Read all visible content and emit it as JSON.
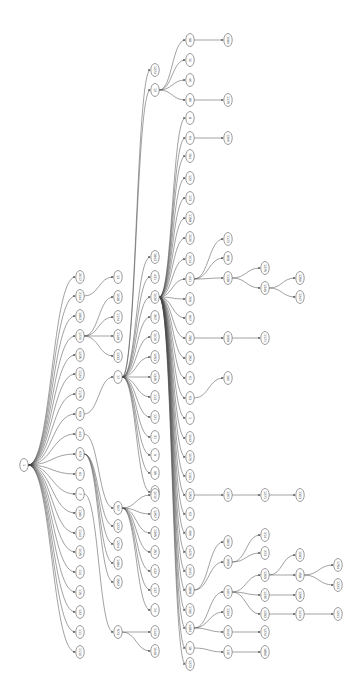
{
  "diagram": {
    "type": "tree",
    "orientation": "left-to-right",
    "root": {
      "id": "r",
      "label": "1",
      "x": 24,
      "y": 465
    },
    "nodes": [
      {
        "id": "a1",
        "label": "2017",
        "x": 80,
        "y": 277
      },
      {
        "id": "a2",
        "label": "2144",
        "x": 80,
        "y": 296
      },
      {
        "id": "a3",
        "label": "1962",
        "x": 80,
        "y": 316
      },
      {
        "id": "a4",
        "label": "1770",
        "x": 80,
        "y": 336
      },
      {
        "id": "a5",
        "label": "1235",
        "x": 80,
        "y": 355
      },
      {
        "id": "a6",
        "label": "1124",
        "x": 80,
        "y": 374
      },
      {
        "id": "a7",
        "label": "1175",
        "x": 80,
        "y": 394
      },
      {
        "id": "a8",
        "label": "609",
        "x": 80,
        "y": 414
      },
      {
        "id": "a9",
        "label": "443",
        "x": 80,
        "y": 434
      },
      {
        "id": "a10",
        "label": "674",
        "x": 80,
        "y": 454
      },
      {
        "id": "a11",
        "label": "91",
        "x": 80,
        "y": 474
      },
      {
        "id": "a12",
        "label": "7",
        "x": 80,
        "y": 494
      },
      {
        "id": "a13",
        "label": "1180",
        "x": 80,
        "y": 513
      },
      {
        "id": "a14",
        "label": "1144",
        "x": 80,
        "y": 533
      },
      {
        "id": "a15",
        "label": "1025",
        "x": 80,
        "y": 552
      },
      {
        "id": "a16",
        "label": "114",
        "x": 80,
        "y": 572
      },
      {
        "id": "a17",
        "label": "115",
        "x": 80,
        "y": 592
      },
      {
        "id": "a18",
        "label": "122",
        "x": 80,
        "y": 612
      },
      {
        "id": "a19",
        "label": "111",
        "x": 80,
        "y": 632
      },
      {
        "id": "a20",
        "label": "1110",
        "x": 80,
        "y": 652
      },
      {
        "id": "b1",
        "label": "13",
        "x": 118,
        "y": 277
      },
      {
        "id": "b2",
        "label": "1038",
        "x": 118,
        "y": 297
      },
      {
        "id": "b3",
        "label": "1174",
        "x": 118,
        "y": 317
      },
      {
        "id": "b4",
        "label": "1149",
        "x": 118,
        "y": 336
      },
      {
        "id": "b5",
        "label": "1233",
        "x": 118,
        "y": 356
      },
      {
        "id": "b6",
        "label": "17",
        "x": 118,
        "y": 377
      },
      {
        "id": "b7",
        "label": "507",
        "x": 118,
        "y": 508
      },
      {
        "id": "b8",
        "label": "1272",
        "x": 118,
        "y": 526
      },
      {
        "id": "b9",
        "label": "1204",
        "x": 118,
        "y": 544
      },
      {
        "id": "b10",
        "label": "1484",
        "x": 118,
        "y": 563
      },
      {
        "id": "b11",
        "label": "1562",
        "x": 118,
        "y": 582
      },
      {
        "id": "b12",
        "label": "573",
        "x": 118,
        "y": 632
      },
      {
        "id": "c1",
        "label": "1274",
        "x": 155,
        "y": 70
      },
      {
        "id": "c2",
        "label": "12",
        "x": 155,
        "y": 90
      },
      {
        "id": "c3",
        "label": "1843",
        "x": 155,
        "y": 257
      },
      {
        "id": "c4",
        "label": "431",
        "x": 155,
        "y": 277
      },
      {
        "id": "c5",
        "label": "1026",
        "x": 155,
        "y": 297
      },
      {
        "id": "c6",
        "label": "367",
        "x": 155,
        "y": 317
      },
      {
        "id": "c7",
        "label": "1016",
        "x": 155,
        "y": 337
      },
      {
        "id": "c8",
        "label": "1053",
        "x": 155,
        "y": 357
      },
      {
        "id": "c9",
        "label": "1345",
        "x": 155,
        "y": 377
      },
      {
        "id": "c10",
        "label": "113",
        "x": 155,
        "y": 397
      },
      {
        "id": "c11",
        "label": "121",
        "x": 155,
        "y": 417
      },
      {
        "id": "c12",
        "label": "31",
        "x": 155,
        "y": 437
      },
      {
        "id": "c13",
        "label": "9",
        "x": 155,
        "y": 455
      },
      {
        "id": "c14",
        "label": "95",
        "x": 155,
        "y": 473
      },
      {
        "id": "c15",
        "label": "170",
        "x": 155,
        "y": 492
      },
      {
        "id": "c16",
        "label": "1010",
        "x": 155,
        "y": 495
      },
      {
        "id": "c17",
        "label": "1257",
        "x": 155,
        "y": 514
      },
      {
        "id": "c18",
        "label": "1365",
        "x": 155,
        "y": 533
      },
      {
        "id": "c19",
        "label": "251",
        "x": 155,
        "y": 552
      },
      {
        "id": "c20",
        "label": "432",
        "x": 155,
        "y": 571
      },
      {
        "id": "c21",
        "label": "137",
        "x": 155,
        "y": 590
      },
      {
        "id": "c22",
        "label": "74",
        "x": 155,
        "y": 610
      },
      {
        "id": "c23",
        "label": "1142",
        "x": 155,
        "y": 632
      },
      {
        "id": "c24",
        "label": "1049",
        "x": 155,
        "y": 651
      },
      {
        "id": "d1",
        "label": "98",
        "x": 190,
        "y": 40
      },
      {
        "id": "d2",
        "label": "10",
        "x": 190,
        "y": 60
      },
      {
        "id": "d3",
        "label": "46",
        "x": 190,
        "y": 80
      },
      {
        "id": "d4",
        "label": "86",
        "x": 190,
        "y": 100
      },
      {
        "id": "d5",
        "label": "8",
        "x": 190,
        "y": 118
      },
      {
        "id": "d6",
        "label": "64",
        "x": 190,
        "y": 138
      },
      {
        "id": "d7",
        "label": "154",
        "x": 190,
        "y": 156
      },
      {
        "id": "d8",
        "label": "122",
        "x": 190,
        "y": 178
      },
      {
        "id": "d9",
        "label": "173",
        "x": 190,
        "y": 198
      },
      {
        "id": "d10",
        "label": "1158",
        "x": 190,
        "y": 218
      },
      {
        "id": "d11",
        "label": "1020",
        "x": 190,
        "y": 238
      },
      {
        "id": "d12",
        "label": "1014",
        "x": 190,
        "y": 259
      },
      {
        "id": "d13",
        "label": "441",
        "x": 190,
        "y": 279
      },
      {
        "id": "d14",
        "label": "709",
        "x": 190,
        "y": 299
      },
      {
        "id": "d15",
        "label": "907",
        "x": 190,
        "y": 318
      },
      {
        "id": "d16",
        "label": "789",
        "x": 190,
        "y": 338
      },
      {
        "id": "d17",
        "label": "252",
        "x": 190,
        "y": 358
      },
      {
        "id": "d18",
        "label": "61",
        "x": 190,
        "y": 378
      },
      {
        "id": "d19",
        "label": "63",
        "x": 190,
        "y": 398
      },
      {
        "id": "d20",
        "label": "1",
        "x": 190,
        "y": 418
      },
      {
        "id": "d21",
        "label": "1042",
        "x": 190,
        "y": 438
      },
      {
        "id": "d22",
        "label": "1076",
        "x": 190,
        "y": 457
      },
      {
        "id": "d23",
        "label": "1191",
        "x": 190,
        "y": 476
      },
      {
        "id": "d24",
        "label": "1253",
        "x": 190,
        "y": 495
      },
      {
        "id": "d25",
        "label": "62",
        "x": 190,
        "y": 514
      },
      {
        "id": "d26",
        "label": "466",
        "x": 190,
        "y": 533
      },
      {
        "id": "d27",
        "label": "1470",
        "x": 190,
        "y": 552
      },
      {
        "id": "d28",
        "label": "1041",
        "x": 190,
        "y": 571
      },
      {
        "id": "d29",
        "label": "1868",
        "x": 190,
        "y": 590
      },
      {
        "id": "d30",
        "label": "1190",
        "x": 190,
        "y": 610
      },
      {
        "id": "d31",
        "label": "1484",
        "x": 190,
        "y": 628
      },
      {
        "id": "d32",
        "label": "18",
        "x": 190,
        "y": 648
      },
      {
        "id": "d33",
        "label": "1272",
        "x": 190,
        "y": 664
      },
      {
        "id": "e1",
        "label": "1084",
        "x": 228,
        "y": 40
      },
      {
        "id": "e2",
        "label": "1175",
        "x": 228,
        "y": 100
      },
      {
        "id": "e3",
        "label": "1206",
        "x": 228,
        "y": 138
      },
      {
        "id": "e4",
        "label": "1172",
        "x": 228,
        "y": 239
      },
      {
        "id": "e5",
        "label": "808",
        "x": 228,
        "y": 258
      },
      {
        "id": "e6",
        "label": "1138",
        "x": 228,
        "y": 278
      },
      {
        "id": "e7",
        "label": "1069",
        "x": 228,
        "y": 338
      },
      {
        "id": "e8",
        "label": "190",
        "x": 228,
        "y": 378
      },
      {
        "id": "e9",
        "label": "1261",
        "x": 228,
        "y": 495
      },
      {
        "id": "e10",
        "label": "1803",
        "x": 228,
        "y": 542
      },
      {
        "id": "e11",
        "label": "1669",
        "x": 228,
        "y": 562
      },
      {
        "id": "e12",
        "label": "1461",
        "x": 228,
        "y": 592
      },
      {
        "id": "e13",
        "label": "1324",
        "x": 228,
        "y": 612
      },
      {
        "id": "e14",
        "label": "1042",
        "x": 228,
        "y": 632
      },
      {
        "id": "e15",
        "label": "116",
        "x": 228,
        "y": 652
      },
      {
        "id": "f1",
        "label": "1275",
        "x": 265,
        "y": 268
      },
      {
        "id": "f2",
        "label": "1349",
        "x": 265,
        "y": 288
      },
      {
        "id": "f3",
        "label": "1171",
        "x": 265,
        "y": 338
      },
      {
        "id": "f4",
        "label": "1271",
        "x": 265,
        "y": 495
      },
      {
        "id": "f5",
        "label": "214",
        "x": 265,
        "y": 535
      },
      {
        "id": "f6",
        "label": "273",
        "x": 265,
        "y": 553
      },
      {
        "id": "f7",
        "label": "1269",
        "x": 265,
        "y": 575
      },
      {
        "id": "f8",
        "label": "1236",
        "x": 265,
        "y": 595
      },
      {
        "id": "f9",
        "label": "1292",
        "x": 265,
        "y": 614
      },
      {
        "id": "f10",
        "label": "1274",
        "x": 265,
        "y": 632
      },
      {
        "id": "f11",
        "label": "1856",
        "x": 265,
        "y": 652
      },
      {
        "id": "g1",
        "label": "1256",
        "x": 300,
        "y": 278
      },
      {
        "id": "g2",
        "label": "1247",
        "x": 300,
        "y": 297
      },
      {
        "id": "g3",
        "label": "1303",
        "x": 300,
        "y": 495
      },
      {
        "id": "g4",
        "label": "1081",
        "x": 300,
        "y": 555
      },
      {
        "id": "g5",
        "label": "458",
        "x": 300,
        "y": 575
      },
      {
        "id": "g6",
        "label": "1295",
        "x": 300,
        "y": 595
      },
      {
        "id": "g7",
        "label": "1414",
        "x": 300,
        "y": 614
      },
      {
        "id": "h1",
        "label": "1754",
        "x": 338,
        "y": 565
      },
      {
        "id": "h2",
        "label": "1223",
        "x": 338,
        "y": 585
      },
      {
        "id": "h3",
        "label": "1241",
        "x": 338,
        "y": 614
      }
    ],
    "edges": [
      [
        "r",
        "a1"
      ],
      [
        "r",
        "a2"
      ],
      [
        "r",
        "a3"
      ],
      [
        "r",
        "a4"
      ],
      [
        "r",
        "a5"
      ],
      [
        "r",
        "a6"
      ],
      [
        "r",
        "a7"
      ],
      [
        "r",
        "a8"
      ],
      [
        "r",
        "a9"
      ],
      [
        "r",
        "a10"
      ],
      [
        "r",
        "a11"
      ],
      [
        "r",
        "a12"
      ],
      [
        "r",
        "a13"
      ],
      [
        "r",
        "a14"
      ],
      [
        "r",
        "a15"
      ],
      [
        "r",
        "a16"
      ],
      [
        "r",
        "a17"
      ],
      [
        "r",
        "a18"
      ],
      [
        "r",
        "a19"
      ],
      [
        "r",
        "a20"
      ],
      [
        "a2",
        "b1"
      ],
      [
        "a4",
        "b2"
      ],
      [
        "a4",
        "b3"
      ],
      [
        "a4",
        "b4"
      ],
      [
        "a4",
        "b5"
      ],
      [
        "a8",
        "b6"
      ],
      [
        "a9",
        "b7"
      ],
      [
        "a10",
        "b8"
      ],
      [
        "a10",
        "b9"
      ],
      [
        "a10",
        "b10"
      ],
      [
        "a10",
        "b11"
      ],
      [
        "a12",
        "b12"
      ],
      [
        "b6",
        "c1"
      ],
      [
        "b6",
        "c2"
      ],
      [
        "b6",
        "c3"
      ],
      [
        "b6",
        "c4"
      ],
      [
        "b6",
        "c5"
      ],
      [
        "b6",
        "c6"
      ],
      [
        "b6",
        "c7"
      ],
      [
        "b6",
        "c8"
      ],
      [
        "b6",
        "c9"
      ],
      [
        "b6",
        "c10"
      ],
      [
        "b6",
        "c11"
      ],
      [
        "b6",
        "c12"
      ],
      [
        "b6",
        "c13"
      ],
      [
        "b6",
        "c14"
      ],
      [
        "b6",
        "c15"
      ],
      [
        "b7",
        "c16"
      ],
      [
        "b7",
        "c17"
      ],
      [
        "b7",
        "c18"
      ],
      [
        "b7",
        "c19"
      ],
      [
        "b7",
        "c20"
      ],
      [
        "b7",
        "c21"
      ],
      [
        "b7",
        "c22"
      ],
      [
        "b12",
        "c23"
      ],
      [
        "b12",
        "c24"
      ],
      [
        "c2",
        "d1"
      ],
      [
        "c2",
        "d2"
      ],
      [
        "c2",
        "d3"
      ],
      [
        "c2",
        "d4"
      ],
      [
        "c5",
        "d5"
      ],
      [
        "c5",
        "d6"
      ],
      [
        "c5",
        "d7"
      ],
      [
        "c5",
        "d8"
      ],
      [
        "c5",
        "d9"
      ],
      [
        "c5",
        "d10"
      ],
      [
        "c5",
        "d11"
      ],
      [
        "c5",
        "d12"
      ],
      [
        "c5",
        "d13"
      ],
      [
        "c5",
        "d14"
      ],
      [
        "c5",
        "d15"
      ],
      [
        "c5",
        "d16"
      ],
      [
        "c5",
        "d17"
      ],
      [
        "c5",
        "d18"
      ],
      [
        "c5",
        "d19"
      ],
      [
        "c5",
        "d20"
      ],
      [
        "c5",
        "d21"
      ],
      [
        "c5",
        "d22"
      ],
      [
        "c5",
        "d23"
      ],
      [
        "c5",
        "d24"
      ],
      [
        "c5",
        "d25"
      ],
      [
        "c5",
        "d26"
      ],
      [
        "c5",
        "d27"
      ],
      [
        "c5",
        "d28"
      ],
      [
        "c5",
        "d29"
      ],
      [
        "c5",
        "d30"
      ],
      [
        "c5",
        "d31"
      ],
      [
        "c5",
        "d32"
      ],
      [
        "c5",
        "d33"
      ],
      [
        "d1",
        "e1"
      ],
      [
        "d4",
        "e2"
      ],
      [
        "d6",
        "e3"
      ],
      [
        "d13",
        "e4"
      ],
      [
        "d13",
        "e5"
      ],
      [
        "d13",
        "e6"
      ],
      [
        "d16",
        "e7"
      ],
      [
        "d19",
        "e8"
      ],
      [
        "d24",
        "e9"
      ],
      [
        "d29",
        "e10"
      ],
      [
        "d29",
        "e11"
      ],
      [
        "d31",
        "e12"
      ],
      [
        "d31",
        "e13"
      ],
      [
        "d31",
        "e14"
      ],
      [
        "d32",
        "e15"
      ],
      [
        "e6",
        "f1"
      ],
      [
        "e6",
        "f2"
      ],
      [
        "e7",
        "f3"
      ],
      [
        "e9",
        "f4"
      ],
      [
        "e11",
        "f5"
      ],
      [
        "e11",
        "f6"
      ],
      [
        "e12",
        "f7"
      ],
      [
        "e12",
        "f8"
      ],
      [
        "e12",
        "f9"
      ],
      [
        "e14",
        "f10"
      ],
      [
        "e15",
        "f11"
      ],
      [
        "f2",
        "g1"
      ],
      [
        "f2",
        "g2"
      ],
      [
        "f4",
        "g3"
      ],
      [
        "f7",
        "g4"
      ],
      [
        "f7",
        "g5"
      ],
      [
        "f8",
        "g6"
      ],
      [
        "f9",
        "g7"
      ],
      [
        "g5",
        "h1"
      ],
      [
        "g5",
        "h2"
      ],
      [
        "g7",
        "h3"
      ]
    ],
    "colors": {
      "node_stroke": "#555555",
      "edge": "#444444",
      "background": "#ffffff"
    }
  }
}
